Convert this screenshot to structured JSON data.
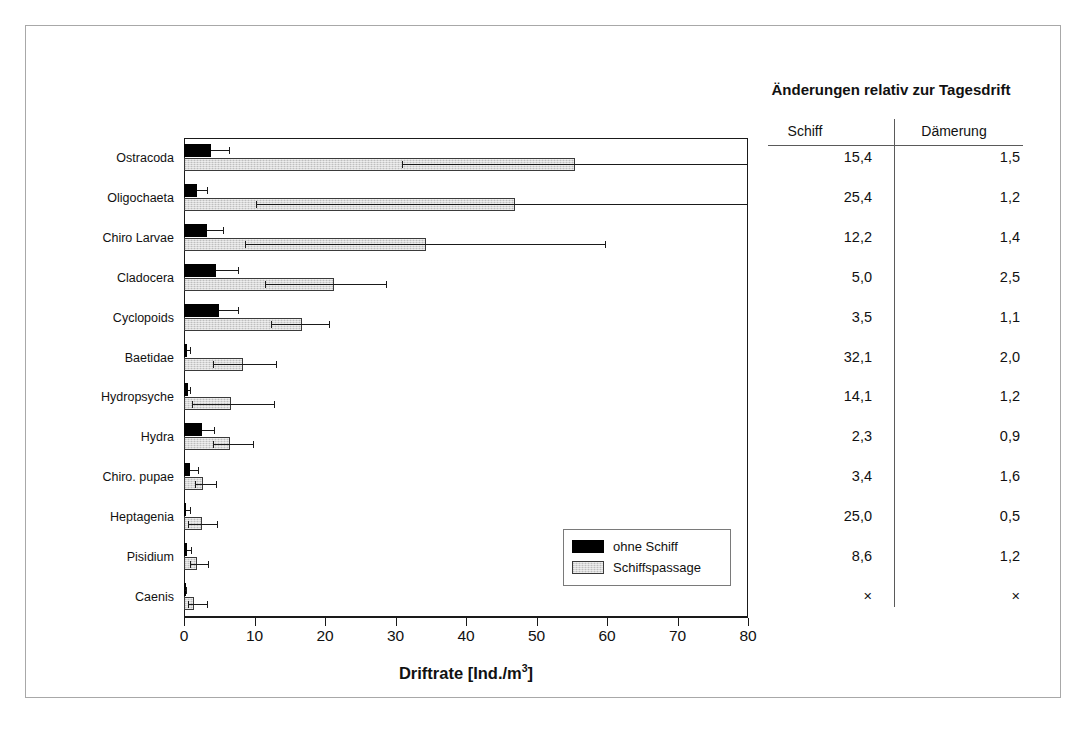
{
  "chart_data": {
    "type": "bar",
    "orientation": "horizontal",
    "title": "",
    "xlabel": "Driftrate [Ind./m³]",
    "ylabel": "",
    "xlim": [
      0,
      80
    ],
    "xticks": [
      0,
      10,
      20,
      30,
      40,
      50,
      60,
      70,
      80
    ],
    "grid": false,
    "legend_position": "inside-lower-right",
    "categories": [
      "Ostracoda",
      "Oligochaeta",
      "Chiro Larvae",
      "Cladocera",
      "Cyclopoids",
      "Baetidae",
      "Hydropsyche",
      "Hydra",
      "Chiro. pupae",
      "Heptagenia",
      "Pisidium",
      "Caenis"
    ],
    "series": [
      {
        "name": "ohne Schiff",
        "color": "#000000",
        "values": [
          3.8,
          1.9,
          3.2,
          4.6,
          4.9,
          0.4,
          0.5,
          2.6,
          0.9,
          0.3,
          0.4,
          0.1
        ],
        "errors_upper": [
          6.4,
          3.2,
          5.6,
          7.6,
          7.6,
          0.9,
          0.9,
          4.2,
          2.0,
          0.9,
          1.0,
          0.3
        ]
      },
      {
        "name": "Schiffspassage",
        "color": "#d8d8d8",
        "values": [
          55.5,
          47.0,
          34.3,
          21.3,
          16.8,
          8.4,
          6.6,
          6.5,
          2.7,
          2.5,
          1.9,
          1.4
        ],
        "errors_lower": [
          30.9,
          10.2,
          8.6,
          11.5,
          12.4,
          4.1,
          1.1,
          4.1,
          1.6,
          0.5,
          0.8,
          0.5
        ],
        "errors_upper": [
          80.0,
          80.0,
          59.8,
          28.8,
          20.7,
          13.2,
          12.9,
          9.9,
          4.7,
          4.8,
          3.5,
          3.4
        ]
      }
    ]
  },
  "legend": {
    "items": [
      {
        "label": "ohne Schiff",
        "swatch": "dark"
      },
      {
        "label": "Schiffspassage",
        "swatch": "light"
      }
    ]
  },
  "side_table": {
    "title": "Änderungen relativ zur Tagesdrift",
    "columns": [
      "Schiff",
      "Dämerung"
    ],
    "rows": [
      {
        "schiff": "15,4",
        "daemerung": "1,5"
      },
      {
        "schiff": "25,4",
        "daemerung": "1,2"
      },
      {
        "schiff": "12,2",
        "daemerung": "1,4"
      },
      {
        "schiff": "5,0",
        "daemerung": "2,5"
      },
      {
        "schiff": "3,5",
        "daemerung": "1,1"
      },
      {
        "schiff": "32,1",
        "daemerung": "2,0"
      },
      {
        "schiff": "14,1",
        "daemerung": "1,2"
      },
      {
        "schiff": "2,3",
        "daemerung": "0,9"
      },
      {
        "schiff": "3,4",
        "daemerung": "1,6"
      },
      {
        "schiff": "25,0",
        "daemerung": "0,5"
      },
      {
        "schiff": "8,6",
        "daemerung": "1,2"
      },
      {
        "schiff": "×",
        "daemerung": "×"
      }
    ]
  },
  "axis": {
    "tick_labels": [
      "0",
      "10",
      "20",
      "30",
      "40",
      "50",
      "60",
      "70",
      "80"
    ],
    "title_main": "Driftrate [Ind./m",
    "title_sup": "3",
    "title_tail": "]"
  }
}
